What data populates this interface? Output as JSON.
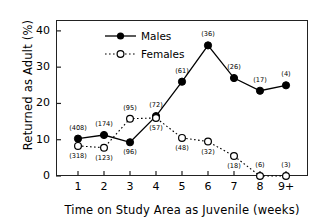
{
  "chart_data": {
    "type": "line",
    "title": "",
    "xlabel": "Time on Study Area as Juvenile (weeks)",
    "ylabel": "Returned as Adult (%)",
    "categories": [
      "1",
      "2",
      "3",
      "4",
      "5",
      "6",
      "7",
      "8",
      "9+"
    ],
    "xtick_labels": [
      "1",
      "2",
      "3",
      "4",
      "5",
      "6",
      "7",
      "8",
      "9+"
    ],
    "ytick_labels": [
      "0",
      "10",
      "20",
      "30",
      "40"
    ],
    "ytick_values": [
      0,
      10,
      20,
      30,
      40
    ],
    "ylim": [
      0,
      43
    ],
    "xlim": [
      0.45,
      9.55
    ],
    "grid": false,
    "legend_position": "top-left-inside",
    "series": [
      {
        "name": "Males",
        "marker": "filled-circle",
        "linestyle": "solid",
        "color": "#000000",
        "values": [
          10.3,
          11.3,
          9.3,
          16.5,
          26.0,
          36.0,
          27.0,
          23.5,
          25.0
        ],
        "point_labels": [
          "(408)",
          "(174)",
          "(96)",
          "(72)",
          "(61)",
          "(36)",
          "(26)",
          "(17)",
          "(4)"
        ],
        "label_side": [
          "above",
          "above",
          "below",
          "above",
          "above",
          "above",
          "above",
          "above",
          "above"
        ]
      },
      {
        "name": "Females",
        "marker": "open-circle",
        "linestyle": "dotted",
        "color": "#000000",
        "values": [
          8.3,
          7.8,
          15.8,
          16.0,
          10.5,
          9.5,
          5.5,
          0.0,
          0.0
        ],
        "point_labels": [
          "(318)",
          "(123)",
          "(95)",
          "(57)",
          "(48)",
          "(32)",
          "(18)",
          "(6)",
          "(3)"
        ],
        "label_side": [
          "below",
          "below",
          "above",
          "below",
          "below",
          "below",
          "below",
          "above",
          "above"
        ]
      }
    ]
  },
  "legend": {
    "males_label": "Males",
    "females_label": "Females"
  }
}
